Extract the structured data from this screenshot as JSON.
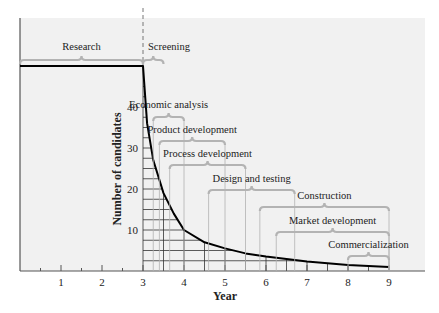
{
  "chart_data": {
    "type": "line",
    "title": "",
    "xlabel": "Year",
    "ylabel": "Number of candidates",
    "xlim": [
      0,
      10
    ],
    "ylim": [
      0,
      50
    ],
    "x_ticks": [
      1,
      2,
      3,
      4,
      5,
      6,
      7,
      8,
      9
    ],
    "y_ticks": [
      10,
      20,
      30,
      40
    ],
    "grid": "hatched grid under curve (x every 0.5 year from 3 to 9, y every 2.5 candidates)",
    "series": [
      {
        "name": "Number of candidates",
        "x": [
          0,
          3,
          3.1,
          3.25,
          3.5,
          3.75,
          4,
          4.5,
          5,
          5.5,
          6,
          7,
          8,
          9
        ],
        "y": [
          50,
          50,
          36,
          27,
          19,
          14,
          10,
          7,
          5.5,
          4.3,
          3.5,
          2.3,
          1.5,
          1
        ]
      }
    ],
    "annotations": [
      {
        "label": "Research",
        "start": 0,
        "end": 3
      },
      {
        "label": "Screening",
        "start": 3,
        "end": 3.5
      },
      {
        "label": "Economic analysis",
        "start": 3.25,
        "end": 4
      },
      {
        "label": "Product development",
        "start": 3.4,
        "end": 5
      },
      {
        "label": "Process development",
        "start": 3.65,
        "end": 5.5
      },
      {
        "label": "Design and testing",
        "start": 4.6,
        "end": 6.7
      },
      {
        "label": "Construction",
        "start": 5.85,
        "end": 9
      },
      {
        "label": "Market development",
        "start": 6.25,
        "end": 9
      },
      {
        "label": "Commercialization",
        "start": 8,
        "end": 9
      }
    ],
    "divider": {
      "x": 3,
      "style": "dashed"
    },
    "colors": {
      "background": "#f1f1f1",
      "curve": "#000000",
      "brackets": "#b3b3b3",
      "grid": "#333333"
    }
  }
}
